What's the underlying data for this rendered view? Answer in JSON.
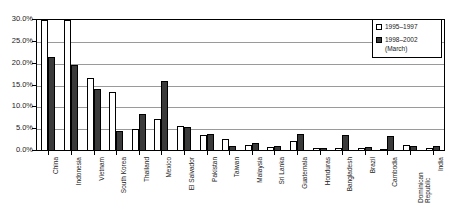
{
  "chart_data": {
    "type": "bar",
    "title": "",
    "subtitle": "",
    "xlabel": "",
    "ylabel": "",
    "ylim": [
      0,
      0.3
    ],
    "ytick_labels": [
      "30.0%",
      "25.0%",
      "20.0%",
      "15.0%",
      "10.0%",
      "5.0%",
      "0.0%"
    ],
    "ytick_values": [
      0.3,
      0.25,
      0.2,
      0.15,
      0.1,
      0.05,
      0.0
    ],
    "grid": true,
    "legend_position": "top-right",
    "value_format": "percent",
    "categories": [
      "China",
      "Indonesia",
      "Vietnam",
      "South Korea",
      "Thailand",
      "Mexico",
      "El Salvador",
      "Pakistan",
      "Taiwan",
      "Malaysia",
      "Sri Lanka",
      "Guatemala",
      "Honduras",
      "Bangladesh",
      "Brazil",
      "Cambodia",
      "Dominican Republic",
      "India"
    ],
    "series": [
      {
        "name": "1995–1997",
        "color": "#ffffff",
        "values": [
          0.322,
          0.322,
          0.167,
          0.135,
          0.051,
          0.074,
          0.057,
          0.036,
          0.028,
          0.014,
          0.01,
          0.022,
          0.007,
          0.006,
          0.008,
          0.004,
          0.013,
          0.007
        ]
      },
      {
        "name": "1998–2002 (March)",
        "color": "#3a3a3a",
        "values": [
          0.215,
          0.196,
          0.142,
          0.045,
          0.085,
          0.16,
          0.055,
          0.038,
          0.012,
          0.019,
          0.012,
          0.04,
          0.008,
          0.037,
          0.01,
          0.034,
          0.012,
          0.011
        ]
      }
    ]
  },
  "legend": {
    "items": [
      {
        "label": "1995–1997",
        "swatch": "series-a"
      },
      {
        "label": "1998–2002",
        "label_line2": "(March)",
        "swatch": "series-b"
      }
    ]
  }
}
